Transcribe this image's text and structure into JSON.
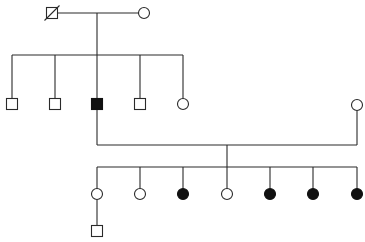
{
  "diagram": {
    "type": "pedigree",
    "colors": {
      "line": "#2a2a2a",
      "affected": "#111111",
      "unaffected": "#ffffff"
    },
    "generations": [
      {
        "id": "I",
        "individuals": [
          {
            "id": "I-1",
            "sex": "male",
            "affected": false,
            "deceased": true,
            "x": 52,
            "y": 13
          },
          {
            "id": "I-2",
            "sex": "female",
            "affected": false,
            "deceased": false,
            "x": 144,
            "y": 13
          }
        ]
      },
      {
        "id": "II",
        "individuals": [
          {
            "id": "II-1",
            "sex": "male",
            "affected": false,
            "x": 12,
            "y": 104
          },
          {
            "id": "II-2",
            "sex": "male",
            "affected": false,
            "x": 55,
            "y": 104
          },
          {
            "id": "II-3",
            "sex": "male",
            "affected": true,
            "x": 97,
            "y": 104
          },
          {
            "id": "II-4",
            "sex": "male",
            "affected": false,
            "x": 140,
            "y": 104
          },
          {
            "id": "II-5",
            "sex": "female",
            "affected": false,
            "x": 183,
            "y": 104
          },
          {
            "id": "II-6",
            "sex": "female",
            "affected": false,
            "spouse_of": "II-3",
            "x": 357,
            "y": 105
          }
        ]
      },
      {
        "id": "III",
        "individuals": [
          {
            "id": "III-1",
            "sex": "female",
            "affected": false,
            "x": 97,
            "y": 194
          },
          {
            "id": "III-2",
            "sex": "female",
            "affected": false,
            "x": 140,
            "y": 194
          },
          {
            "id": "III-3",
            "sex": "female",
            "affected": true,
            "x": 183,
            "y": 194
          },
          {
            "id": "III-4",
            "sex": "female",
            "affected": false,
            "x": 227,
            "y": 194
          },
          {
            "id": "III-5",
            "sex": "female",
            "affected": true,
            "x": 270,
            "y": 194
          },
          {
            "id": "III-6",
            "sex": "female",
            "affected": true,
            "x": 313,
            "y": 194
          },
          {
            "id": "III-7",
            "sex": "female",
            "affected": true,
            "x": 357,
            "y": 194
          }
        ]
      },
      {
        "id": "IV",
        "individuals": [
          {
            "id": "IV-1",
            "sex": "male",
            "affected": false,
            "parent": "III-1",
            "x": 97,
            "y": 231
          }
        ]
      }
    ],
    "matings": [
      {
        "partners": [
          "I-1",
          "I-2"
        ],
        "y": 13,
        "descent_x": 97,
        "sibship_y": 55
      },
      {
        "partners": [
          "II-3",
          "II-6"
        ],
        "y": 145,
        "descent_x": 227,
        "sibship_y": 167
      }
    ]
  }
}
